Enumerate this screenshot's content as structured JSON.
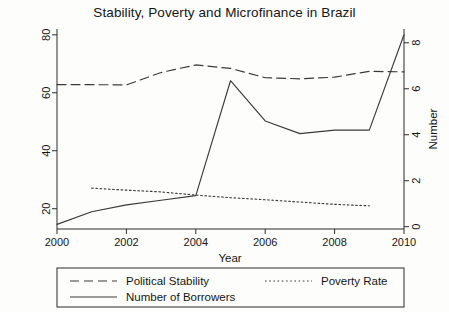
{
  "chart_data": {
    "type": "line",
    "title": "Stability, Poverty and Microfinance in Brazil",
    "xlabel": "Year",
    "ylabel": "",
    "ylabel_right": "Number",
    "x": [
      2000,
      2001,
      2002,
      2003,
      2004,
      2005,
      2006,
      2007,
      2008,
      2009,
      2010
    ],
    "xlim": [
      2000,
      2010
    ],
    "xticks": [
      2000,
      2002,
      2004,
      2006,
      2008,
      2010
    ],
    "xticklabels": [
      "2000",
      "2002",
      "2004",
      "2006",
      "2008",
      "2010"
    ],
    "ylim": [
      13,
      82
    ],
    "yticks": [
      20,
      40,
      60,
      80
    ],
    "yticklabels": [
      "20",
      "40",
      "60",
      "80"
    ],
    "ylim_right": [
      -0.1,
      8.6
    ],
    "yticks_right": [
      0,
      2,
      4,
      6,
      8
    ],
    "yticklabels_right": [
      "0",
      "2",
      "4",
      "6",
      "8"
    ],
    "grid": false,
    "legend_position": "below-axes",
    "series": [
      {
        "name": "Political Stability",
        "axis": "left",
        "style": "dashed",
        "x": [
          2000,
          2001,
          2002,
          2003,
          2004,
          2005,
          2006,
          2007,
          2008,
          2009,
          2010
        ],
        "values": [
          62.8,
          62.8,
          62.7,
          67.0,
          69.6,
          68.4,
          65.2,
          64.8,
          65.4,
          67.4,
          67.2
        ]
      },
      {
        "name": "Poverty Rate",
        "axis": "left",
        "style": "dotted",
        "x": [
          2001,
          2002,
          2003,
          2004,
          2005,
          2006,
          2007,
          2008,
          2009
        ],
        "values": [
          27.1,
          26.4,
          25.8,
          24.7,
          23.8,
          23.1,
          22.3,
          21.5,
          21.0
        ]
      },
      {
        "name": "Number of Borrowers",
        "axis": "right",
        "style": "solid",
        "x": [
          2000,
          2001,
          2002,
          2003,
          2004,
          2005,
          2006,
          2007,
          2008,
          2009,
          2010
        ],
        "values": [
          0.1,
          0.65,
          0.95,
          1.15,
          1.35,
          6.35,
          4.6,
          4.05,
          4.2,
          4.2,
          8.35
        ]
      }
    ],
    "legend_entries": [
      {
        "label": "Political Stability",
        "style": "dashed"
      },
      {
        "label": "Poverty Rate",
        "style": "dotted"
      },
      {
        "label": "Number of Borrowers",
        "style": "solid"
      }
    ]
  }
}
